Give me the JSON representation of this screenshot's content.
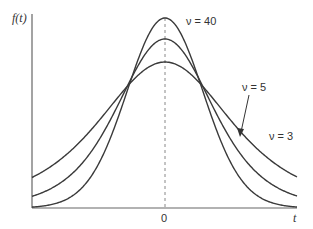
{
  "chart_data": {
    "type": "line",
    "title": "",
    "xlabel": "t",
    "ylabel": "f(t)",
    "x_ticks": [
      "0"
    ],
    "grid": false,
    "legend": "inline annotations",
    "series": [
      {
        "name": "ν = 40",
        "nu": 40,
        "peak_px_y": 18,
        "tail_px_y": 207
      },
      {
        "name": "ν = 5",
        "nu": 5,
        "peak_px_y": 39,
        "tail_px_y": 196
      },
      {
        "name": "ν = 3",
        "nu": 3,
        "peak_px_y": 62,
        "tail_px_y": 177
      }
    ],
    "annotations": [
      {
        "text": "ν = 40",
        "target": "peak of ν = 40 curve"
      },
      {
        "text": "ν = 5",
        "target": "ν = 5 curve (arrow)"
      },
      {
        "text": "ν = 3",
        "target": "right tail of ν = 3 curve"
      }
    ],
    "reference_line": {
      "x": 0,
      "style": "dashed vertical"
    }
  },
  "labels": {
    "y_axis": "f(t)",
    "x_axis": "t",
    "zero": "0",
    "nu40": "ν = 40",
    "nu5": "ν = 5",
    "nu3": "ν = 3"
  },
  "colors": {
    "curve": "#3a3a3a",
    "axis": "#555555",
    "dashed": "#888888"
  }
}
